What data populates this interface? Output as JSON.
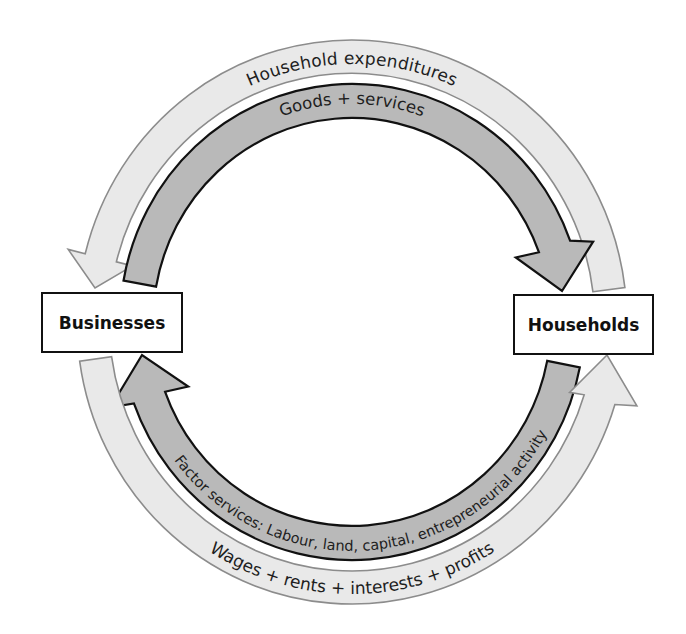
{
  "diagram": {
    "type": "circular-flow",
    "nodes": {
      "businesses": "Businesses",
      "households": "Households"
    },
    "flows": {
      "household_expenditures": "Household expenditures",
      "goods_services": "Goods + services",
      "factor_services": "Factor services: Labour, land, capital, entrepreneurial activity",
      "wages": "Wages + rents + interests + profits"
    },
    "colors": {
      "money_flow_fill": "#e9e9e9",
      "money_flow_stroke": "#8c8c8c",
      "real_flow_fill": "#b9b9b9",
      "real_flow_stroke": "#111111"
    }
  }
}
